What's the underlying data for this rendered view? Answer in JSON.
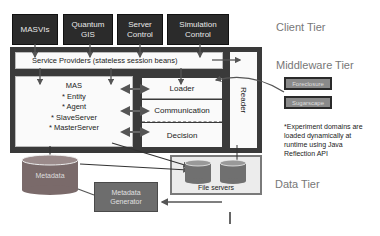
{
  "client_tier": {
    "label": "Client Tier",
    "components": [
      "MASVIs",
      "Quantum GIS",
      "Server Control",
      "Simulation Control"
    ]
  },
  "middleware_tier": {
    "label": "Middleware Tier",
    "service_providers": "Service Providers (stateless session beans)",
    "mas": {
      "title": "MAS",
      "items": [
        "* Entity",
        "* Agent",
        "* SlaveServer",
        "* MasterServer"
      ]
    },
    "modules": [
      "Loader",
      "Communication",
      "Decision"
    ],
    "reader": "Reader",
    "experiment_domains": [
      "Foreclosure",
      "Sugarscape"
    ],
    "note": "*Experiment domains are loaded dynamically at runtime using Java Reflection API"
  },
  "data_tier": {
    "label": "Data Tier",
    "metadata": "Metadata",
    "metadata_generator": "Metadata Generator",
    "file_servers": "File servers"
  },
  "colors": {
    "client_box": "#2b2b2b",
    "frame": "#3a3a3a",
    "domain_box": "#8a8a8a",
    "metadata_cylinder": "#7a6a6a",
    "generator": "#6d6d6d",
    "arrow": "#555555"
  }
}
